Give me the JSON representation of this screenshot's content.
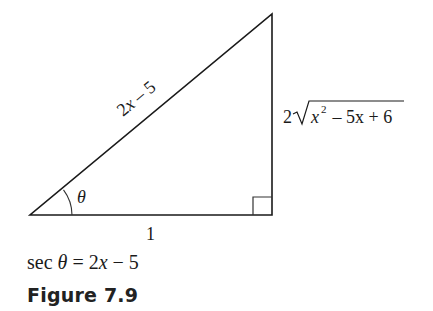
{
  "figure": {
    "vertices": {
      "angle_vertex": [
        30,
        215
      ],
      "right_angle_vertex": [
        272,
        215
      ],
      "top_vertex": [
        272,
        14
      ]
    },
    "sides": {
      "hypotenuse": {
        "label_coeff": "2",
        "label_var": "x",
        "label_rest": " – 5"
      },
      "adjacent": {
        "label": "1"
      },
      "opposite": {
        "coeff": "2",
        "radical_sign": "√",
        "var": "x",
        "exp": "2",
        "rest": " – 5x + 6"
      }
    },
    "angle_label": "θ",
    "right_angle_marker": true,
    "colors": {
      "line": "#1a1a1a",
      "text": "#1a1a1a",
      "background": "#ffffff"
    }
  },
  "caption": {
    "equation_func": "sec ",
    "equation_theta": "θ",
    "equation_eq": " = 2",
    "equation_var": "x",
    "equation_rest": " − 5",
    "figure_label": "Figure 7.9"
  }
}
